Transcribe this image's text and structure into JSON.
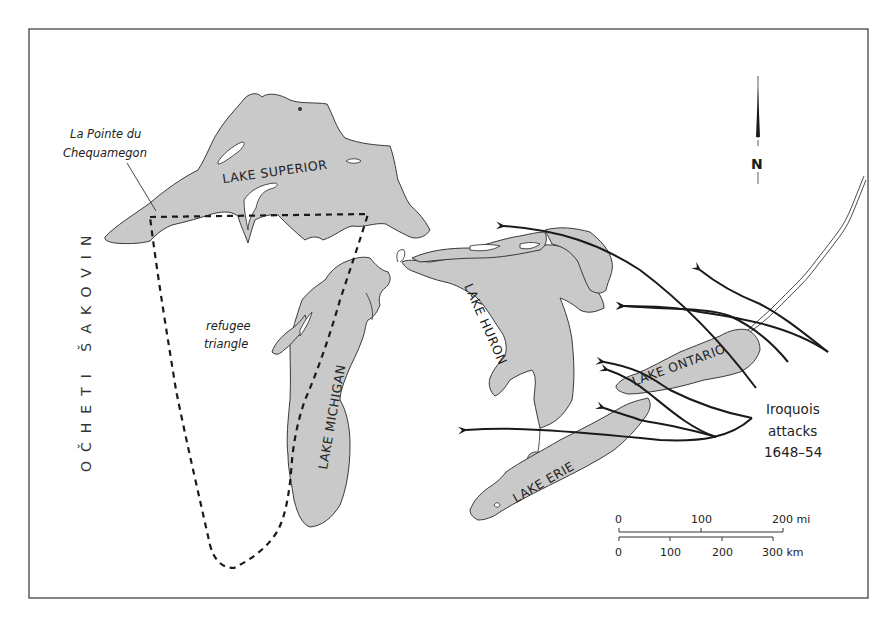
{
  "map": {
    "frame": {
      "x": 29,
      "y": 29,
      "width": 839,
      "height": 569
    },
    "colors": {
      "water_fill": "#c9c9c9",
      "line": "#1a1a1a",
      "background": "#ffffff"
    },
    "labels": {
      "lake_superior": "LAKE SUPERIOR",
      "lake_michigan": "LAKE MICHIGAN",
      "lake_huron": "LAKE HURON",
      "lake_erie": "LAKE ERIE",
      "lake_ontario": "LAKE ONTARIO",
      "la_pointe_line1": "La Pointe du",
      "la_pointe_line2": "Chequamegon",
      "refugee_line1": "refugee",
      "refugee_line2": "triangle",
      "nation": "OČHETI ŠAKOVIN",
      "attacks_line1": "Iroquois",
      "attacks_line2": "attacks",
      "attacks_line3": "1648–54"
    },
    "compass": {
      "label": "N",
      "icon": "north-arrow-icon"
    },
    "scale_bar": {
      "miles": {
        "ticks": [
          "0",
          "100",
          "200 mi"
        ]
      },
      "kilometers": {
        "ticks": [
          "0",
          "100",
          "200",
          "300 km"
        ]
      }
    },
    "legend_features": [
      {
        "name": "refugee-triangle-boundary",
        "style": "dashed line"
      },
      {
        "name": "iroquois-attack-routes",
        "style": "solid arrows",
        "count": 8
      }
    ]
  }
}
